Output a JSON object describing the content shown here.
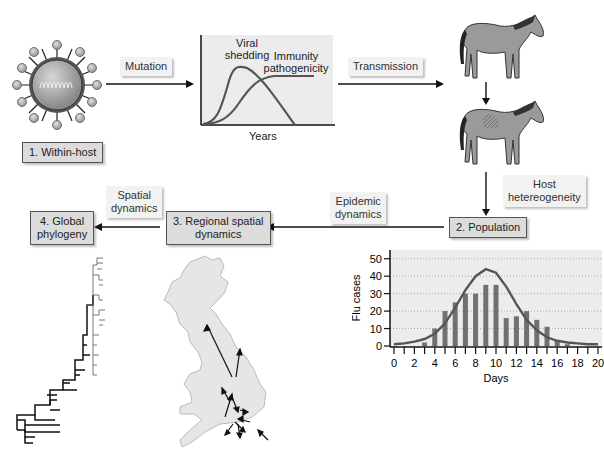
{
  "stages": {
    "within_host": "1. Within-host",
    "population": "2. Population",
    "regional_l1": "3. Regional spatial",
    "regional_l2": "dynamics",
    "global_l1": "4. Global",
    "global_l2": "phylogeny"
  },
  "processes": {
    "mutation": "Mutation",
    "transmission": "Transmission",
    "host_l1": "Host",
    "host_l2": "hetereogeneity",
    "epidemic_l1": "Epidemic",
    "epidemic_l2": "dynamics",
    "spatial_l1": "Spatial",
    "spatial_l2": "dynamics"
  },
  "within_host_chart": {
    "curve1_l1": "Viral",
    "curve1_l2": "shedding",
    "curve2_l1": "Immunity",
    "curve2_l2": "pathogenicity",
    "xlabel": "Years"
  },
  "chart_data": {
    "type": "bar",
    "title": "",
    "xlabel": "Days",
    "ylabel": "Flu cases",
    "x": [
      0,
      1,
      2,
      3,
      4,
      5,
      6,
      7,
      8,
      9,
      10,
      11,
      12,
      13,
      14,
      15,
      16,
      17,
      18,
      19,
      20
    ],
    "values": [
      0,
      0,
      0,
      2,
      10,
      20,
      25,
      30,
      30,
      35,
      35,
      16,
      17,
      20,
      15,
      11,
      3,
      1,
      0,
      0,
      0
    ],
    "fitted_curve_peak": {
      "x": 9,
      "y": 44
    },
    "xticks": [
      "0",
      "2",
      "4",
      "6",
      "8",
      "10",
      "12",
      "14",
      "16",
      "18",
      "20"
    ],
    "yticks": [
      "0",
      "10",
      "20",
      "30",
      "40",
      "50"
    ],
    "ylim": [
      0,
      55
    ],
    "xlim": [
      0,
      20
    ],
    "grid": "horizontal dotted",
    "series": [
      {
        "name": "Observed flu cases",
        "type": "bar",
        "values": [
          0,
          0,
          0,
          2,
          10,
          20,
          25,
          30,
          30,
          35,
          35,
          16,
          17,
          20,
          15,
          11,
          3,
          1,
          0,
          0,
          0
        ]
      },
      {
        "name": "Fitted epidemic curve",
        "type": "line",
        "values": [
          1,
          1.5,
          2.5,
          4,
          7,
          13,
          22,
          32,
          40,
          44,
          42,
          34,
          24,
          15,
          9,
          5,
          3,
          2,
          1.5,
          1,
          1
        ]
      }
    ]
  },
  "colors": {
    "box_fill": "#dcdcdc",
    "label_fill": "#f2f2f2",
    "chart_bg": "#ececec",
    "bar": "#707070",
    "curve": "#555555",
    "horse": "#9a9a9a",
    "map": "#e6e6e6"
  }
}
